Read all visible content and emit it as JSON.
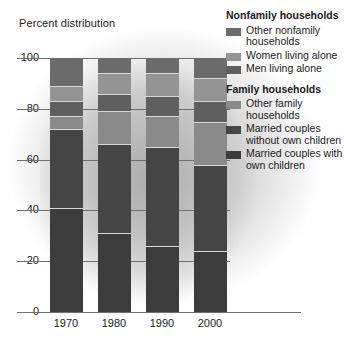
{
  "chart_data": {
    "type": "bar",
    "subtype": "stacked-percent",
    "title": "Percent distribution",
    "xlabel": "",
    "ylabel": "Percent distribution",
    "categories": [
      "1970",
      "1980",
      "1990",
      "2000"
    ],
    "ylim": [
      0,
      100
    ],
    "yticks": [
      0,
      20,
      40,
      60,
      80,
      100
    ],
    "ytick_labels": [
      "0",
      "20",
      "40",
      "60",
      "80",
      "100"
    ],
    "grid": true,
    "legend_position": "right",
    "series": [
      {
        "name": "Married couples with own children",
        "group": "Family households",
        "color": "#3c3c3c",
        "values": [
          41,
          31,
          26,
          24
        ]
      },
      {
        "name": "Married couples without own children",
        "group": "Family households",
        "color": "#454545",
        "values": [
          31,
          35,
          39,
          34
        ]
      },
      {
        "name": "Other family households",
        "group": "Family households",
        "color": "#8a8a8a",
        "values": [
          5,
          13,
          12,
          17
        ]
      },
      {
        "name": "Men living alone",
        "group": "Nonfamily households",
        "color": "#5f5f5f",
        "values": [
          6,
          7,
          8,
          8
        ]
      },
      {
        "name": "Women living alone",
        "group": "Nonfamily households",
        "color": "#949494",
        "values": [
          6,
          8,
          9,
          9
        ]
      },
      {
        "name": "Other nonfamily households",
        "group": "Nonfamily households",
        "color": "#6b6b6b",
        "values": [
          11,
          6,
          6,
          8
        ]
      }
    ]
  },
  "axis": {
    "title": "Percent distribution",
    "ytick_labels": [
      "100",
      "80",
      "60",
      "40",
      "20",
      "0"
    ],
    "xtick_labels": [
      "1970",
      "1980",
      "1990",
      "2000"
    ]
  },
  "legend": {
    "groups": [
      {
        "heading": "Nonfamily households",
        "items": [
          {
            "label": "Other nonfamily households",
            "color": "#6b6b6b"
          },
          {
            "label": "Women living alone",
            "color": "#949494"
          },
          {
            "label": "Men living alone",
            "color": "#5f5f5f"
          }
        ]
      },
      {
        "heading": "Family households",
        "items": [
          {
            "label": "Other family households",
            "color": "#8a8a8a"
          },
          {
            "label": "Married couples without own children",
            "color": "#454545"
          },
          {
            "label": "Married couples with own children",
            "color": "#3c3c3c"
          }
        ]
      }
    ]
  }
}
